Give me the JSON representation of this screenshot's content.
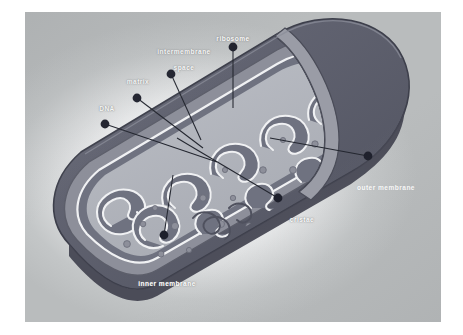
{
  "figure": {
    "background_color": "#b9bcbd",
    "halo_color": "#ffffff",
    "label_color": "#ffffff",
    "leader_dot_color": "#1d1f2b",
    "leader_line_color": "#23262f",
    "outer_membrane_color": "#5d5f6d",
    "outer_membrane_shadow_color": "#494b58",
    "intermembrane_color": "#8b8d98",
    "cristae_color": "#6f7280",
    "matrix_color": "#b3b6bd",
    "cut_face_color": "#9a9ca6",
    "highlight_color": "#f2f3f5"
  },
  "labels": [
    {
      "id": "ribosome",
      "text": "ribosome"
    },
    {
      "id": "intermembrane",
      "text": "intermembrane"
    },
    {
      "id": "space",
      "text": "space"
    },
    {
      "id": "matrix",
      "text": "matrix"
    },
    {
      "id": "dna",
      "text": "DNA"
    },
    {
      "id": "outer_membrane",
      "text": "outer membrane"
    },
    {
      "id": "cristae",
      "text": "cristae"
    },
    {
      "id": "inner_membrane",
      "text": "inner membrane"
    }
  ]
}
